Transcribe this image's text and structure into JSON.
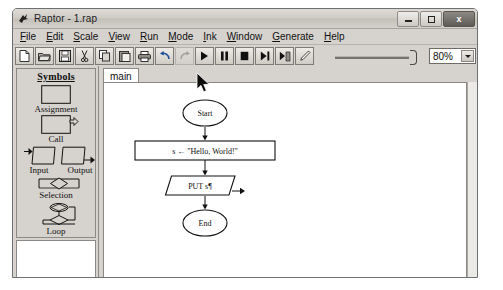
{
  "window": {
    "title": "Raptor - 1.rap",
    "app_icon": "raptor-bird-icon",
    "controls": {
      "minimize": "minimize-icon",
      "maximize": "maximize-icon",
      "close": "x"
    }
  },
  "menubar": {
    "items": [
      {
        "label": "File",
        "accel": "F"
      },
      {
        "label": "Edit",
        "accel": "E"
      },
      {
        "label": "Scale",
        "accel": "S"
      },
      {
        "label": "View",
        "accel": "V"
      },
      {
        "label": "Run",
        "accel": "R"
      },
      {
        "label": "Mode",
        "accel": "M"
      },
      {
        "label": "Ink",
        "accel": "I"
      },
      {
        "label": "Window",
        "accel": "W"
      },
      {
        "label": "Generate",
        "accel": "G"
      },
      {
        "label": "Help",
        "accel": "H"
      }
    ]
  },
  "toolbar": {
    "buttons": [
      {
        "name": "new-file-icon",
        "disabled": false
      },
      {
        "name": "open-folder-icon",
        "disabled": false
      },
      {
        "name": "save-disk-icon",
        "disabled": false
      },
      {
        "name": "cut-icon",
        "disabled": false
      },
      {
        "name": "copy-icon",
        "disabled": false
      },
      {
        "name": "paste-icon",
        "disabled": false
      },
      {
        "name": "print-icon",
        "disabled": false
      },
      {
        "name": "undo-icon",
        "disabled": false
      },
      {
        "name": "redo-icon",
        "disabled": true
      },
      {
        "name": "play-run-icon",
        "disabled": false
      },
      {
        "name": "pause-icon",
        "disabled": false
      },
      {
        "name": "stop-icon",
        "disabled": false
      },
      {
        "name": "step-over-icon",
        "disabled": false
      },
      {
        "name": "step-into-icon",
        "disabled": false
      },
      {
        "name": "pen-ink-icon",
        "disabled": false
      }
    ],
    "speed_slider": {
      "name": "speed-slider",
      "position": "max"
    },
    "zoom": {
      "value": "80%",
      "options": [
        "25%",
        "50%",
        "75%",
        "80%",
        "100%",
        "150%",
        "200%"
      ]
    }
  },
  "symbols_panel": {
    "title": "Symbols",
    "items": [
      {
        "label": "Assignment",
        "shape": "rectangle"
      },
      {
        "label": "Call",
        "shape": "rectangle-with-arrow"
      },
      {
        "label": "Input",
        "shape": "parallelogram-in"
      },
      {
        "label": "Output",
        "shape": "parallelogram-out"
      },
      {
        "label": "Selection",
        "shape": "diamond-branch"
      },
      {
        "label": "Loop",
        "shape": "loop-diamond"
      }
    ]
  },
  "workspace": {
    "tabs": [
      {
        "label": "main",
        "active": true
      }
    ],
    "flowchart": {
      "nodes": [
        {
          "id": "start",
          "type": "terminal",
          "label": "Start"
        },
        {
          "id": "assign",
          "type": "assignment",
          "label": "s ← \"Hello, World!\""
        },
        {
          "id": "output",
          "type": "output",
          "label": "PUT s¶"
        },
        {
          "id": "end",
          "type": "terminal",
          "label": "End"
        }
      ],
      "edges": [
        {
          "from": "start",
          "to": "assign"
        },
        {
          "from": "assign",
          "to": "output"
        },
        {
          "from": "output",
          "to": "end"
        }
      ]
    }
  },
  "cursor": {
    "name": "mouse-pointer",
    "x": 196,
    "y": 72
  },
  "colors": {
    "window_face": "#d6d3ce",
    "canvas": "#ffffff",
    "border": "#8c8984",
    "text": "#111111",
    "title_bar_start": "#dedbd6",
    "title_bar_end": "#d4d1cb"
  }
}
